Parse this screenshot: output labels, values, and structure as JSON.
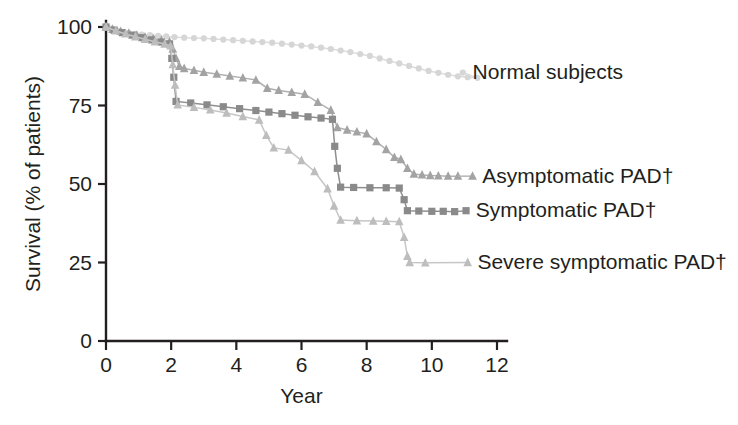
{
  "chart_data": {
    "type": "line",
    "title": "",
    "xlabel": "Year",
    "ylabel": "Survival (% of patients)",
    "xlim": [
      0,
      12
    ],
    "ylim": [
      0,
      100
    ],
    "xticks": [
      0,
      2,
      4,
      6,
      8,
      10,
      12
    ],
    "yticks": [
      0,
      25,
      50,
      75,
      100
    ],
    "grid": false,
    "legend_position": "right-inline-annotations",
    "footnote_symbol": "†",
    "series": [
      {
        "name": "Normal subjects",
        "label": "Normal subjects",
        "marker": "circle",
        "color": "#d6d6d6",
        "line_color": "#dcdcdc",
        "legend_marker_x": 10.95,
        "legend_marker_y": 85.5,
        "legend_text_x": 11.25,
        "points": [
          [
            0.0,
            100.0
          ],
          [
            0.12,
            99.6
          ],
          [
            0.25,
            99.2
          ],
          [
            0.4,
            98.8
          ],
          [
            0.55,
            98.4
          ],
          [
            0.7,
            98.1
          ],
          [
            0.9,
            97.8
          ],
          [
            1.1,
            97.6
          ],
          [
            1.35,
            97.4
          ],
          [
            1.6,
            97.2
          ],
          [
            1.85,
            97.0
          ],
          [
            2.1,
            96.8
          ],
          [
            2.4,
            96.6
          ],
          [
            2.7,
            96.5
          ],
          [
            3.0,
            96.4
          ],
          [
            3.3,
            96.2
          ],
          [
            3.6,
            96.0
          ],
          [
            3.9,
            95.8
          ],
          [
            4.2,
            95.6
          ],
          [
            4.5,
            95.4
          ],
          [
            4.8,
            95.2
          ],
          [
            5.1,
            95.0
          ],
          [
            5.4,
            94.7
          ],
          [
            5.7,
            94.4
          ],
          [
            6.0,
            94.1
          ],
          [
            6.3,
            93.8
          ],
          [
            6.6,
            93.4
          ],
          [
            6.9,
            93.0
          ],
          [
            7.2,
            92.5
          ],
          [
            7.5,
            92.0
          ],
          [
            7.8,
            91.4
          ],
          [
            8.1,
            90.8
          ],
          [
            8.4,
            90.0
          ],
          [
            8.7,
            89.2
          ],
          [
            9.0,
            88.4
          ],
          [
            9.3,
            87.6
          ],
          [
            9.6,
            86.8
          ],
          [
            9.9,
            86.0
          ],
          [
            10.2,
            85.4
          ],
          [
            10.5,
            84.8
          ],
          [
            10.8,
            84.3
          ],
          [
            11.1,
            84.0
          ],
          [
            11.4,
            83.8
          ]
        ]
      },
      {
        "name": "Asymptomatic PAD",
        "label": "Asymptomatic PAD†",
        "marker": "triangle",
        "color": "#a3a3a3",
        "line_color": "#b0b0b0",
        "legend_marker_x": 11.25,
        "legend_marker_y": 52.5,
        "legend_text_x": 11.55,
        "points": [
          [
            0.0,
            100.0
          ],
          [
            0.2,
            99.3
          ],
          [
            0.45,
            98.6
          ],
          [
            0.7,
            98.0
          ],
          [
            0.95,
            97.4
          ],
          [
            1.2,
            96.8
          ],
          [
            1.45,
            96.3
          ],
          [
            1.7,
            95.8
          ],
          [
            1.95,
            95.3
          ],
          [
            2.05,
            93.0
          ],
          [
            2.15,
            90.0
          ],
          [
            2.25,
            87.5
          ],
          [
            2.4,
            86.8
          ],
          [
            2.7,
            86.2
          ],
          [
            3.0,
            85.6
          ],
          [
            3.4,
            85.0
          ],
          [
            3.8,
            84.4
          ],
          [
            4.2,
            83.8
          ],
          [
            4.6,
            83.1
          ],
          [
            4.95,
            80.5
          ],
          [
            5.3,
            79.8
          ],
          [
            5.7,
            79.2
          ],
          [
            6.1,
            78.6
          ],
          [
            6.5,
            76.0
          ],
          [
            6.9,
            73.5
          ],
          [
            7.1,
            68.0
          ],
          [
            7.4,
            67.2
          ],
          [
            7.7,
            66.6
          ],
          [
            8.0,
            66.0
          ],
          [
            8.3,
            63.5
          ],
          [
            8.6,
            61.0
          ],
          [
            8.85,
            58.5
          ],
          [
            9.05,
            57.8
          ],
          [
            9.25,
            55.0
          ],
          [
            9.45,
            53.2
          ],
          [
            9.7,
            52.9
          ],
          [
            9.95,
            52.7
          ],
          [
            10.2,
            52.6
          ],
          [
            10.5,
            52.5
          ],
          [
            10.8,
            52.5
          ]
        ]
      },
      {
        "name": "Symptomatic PAD",
        "label": "Symptomatic PAD†",
        "marker": "square",
        "color": "#8a8a8a",
        "line_color": "#8f8f8f",
        "legend_marker_x": 11.05,
        "legend_marker_y": 41.5,
        "legend_text_x": 11.35,
        "points": [
          [
            0.0,
            100.0
          ],
          [
            0.25,
            99.0
          ],
          [
            0.5,
            98.2
          ],
          [
            0.8,
            97.4
          ],
          [
            1.1,
            96.6
          ],
          [
            1.4,
            95.9
          ],
          [
            1.7,
            95.2
          ],
          [
            1.95,
            94.6
          ],
          [
            2.02,
            90.0
          ],
          [
            2.08,
            84.0
          ],
          [
            2.15,
            76.3
          ],
          [
            2.6,
            75.8
          ],
          [
            3.1,
            75.2
          ],
          [
            3.6,
            74.6
          ],
          [
            4.1,
            74.0
          ],
          [
            4.6,
            73.4
          ],
          [
            5.0,
            72.9
          ],
          [
            5.4,
            72.4
          ],
          [
            5.8,
            71.9
          ],
          [
            6.2,
            71.4
          ],
          [
            6.6,
            71.0
          ],
          [
            6.95,
            70.6
          ],
          [
            7.02,
            62.0
          ],
          [
            7.1,
            55.0
          ],
          [
            7.2,
            49.0
          ],
          [
            7.6,
            48.9
          ],
          [
            8.1,
            48.8
          ],
          [
            8.6,
            48.8
          ],
          [
            9.0,
            48.7
          ],
          [
            9.15,
            45.0
          ],
          [
            9.25,
            41.5
          ],
          [
            9.6,
            41.4
          ],
          [
            10.0,
            41.3
          ],
          [
            10.35,
            41.3
          ],
          [
            10.7,
            41.2
          ]
        ]
      },
      {
        "name": "Severe symptomatic PAD",
        "label": "Severe symptomatic PAD†",
        "marker": "triangle",
        "color": "#bdbdbd",
        "line_color": "#c6c6c6",
        "legend_marker_x": 11.1,
        "legend_marker_y": 25.0,
        "legend_text_x": 11.4,
        "points": [
          [
            0.0,
            100.0
          ],
          [
            0.3,
            98.8
          ],
          [
            0.6,
            97.8
          ],
          [
            0.9,
            96.9
          ],
          [
            1.2,
            96.1
          ],
          [
            1.5,
            95.3
          ],
          [
            1.8,
            94.6
          ],
          [
            1.98,
            94.0
          ],
          [
            2.05,
            88.0
          ],
          [
            2.12,
            81.5
          ],
          [
            2.2,
            75.2
          ],
          [
            2.7,
            74.4
          ],
          [
            3.2,
            73.6
          ],
          [
            3.7,
            72.6
          ],
          [
            4.2,
            71.5
          ],
          [
            4.7,
            70.4
          ],
          [
            4.92,
            65.5
          ],
          [
            5.15,
            61.5
          ],
          [
            5.6,
            60.8
          ],
          [
            6.0,
            57.5
          ],
          [
            6.4,
            54.0
          ],
          [
            6.8,
            48.5
          ],
          [
            7.0,
            43.0
          ],
          [
            7.2,
            38.5
          ],
          [
            7.7,
            38.3
          ],
          [
            8.2,
            38.2
          ],
          [
            8.6,
            38.1
          ],
          [
            9.0,
            38.0
          ],
          [
            9.15,
            33.0
          ],
          [
            9.25,
            27.0
          ],
          [
            9.32,
            25.0
          ],
          [
            9.8,
            24.9
          ]
        ]
      }
    ]
  },
  "axis": {
    "x_tick_labels": [
      "0",
      "2",
      "4",
      "6",
      "8",
      "10",
      "12"
    ],
    "y_tick_labels": [
      "0",
      "25",
      "50",
      "75",
      "100"
    ],
    "x_title": "Year",
    "y_title": "Survival (% of patients)"
  },
  "colors": {
    "axis": "#231f20",
    "normal": "#d6d6d6",
    "asymptomatic": "#a3a3a3",
    "symptomatic": "#8a8a8a",
    "severe": "#bdbdbd",
    "background": "#ffffff"
  }
}
